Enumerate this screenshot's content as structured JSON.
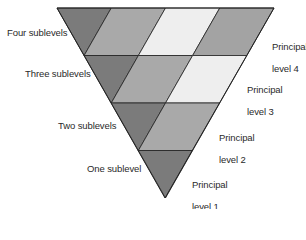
{
  "colors": {
    "dark": "#7b7b7b",
    "mid": "#a9a9a9",
    "mid2": "#a3a3a3",
    "light": "#eeeeee",
    "stroke": "#222222"
  },
  "left_labels": [
    {
      "text": "Four sublevels",
      "x": 7,
      "y": 27
    },
    {
      "text": "Three sublevels",
      "x": 25,
      "y": 68
    },
    {
      "text": "Two sublevels",
      "x": 58,
      "y": 120
    },
    {
      "text": "One sublevel",
      "x": 87,
      "y": 163
    }
  ],
  "right_labels": [
    {
      "line1": "Principal",
      "line2": "level 4",
      "x": 272,
      "y": 30
    },
    {
      "line1": "Principal",
      "line2": "level 3",
      "x": 247,
      "y": 73
    },
    {
      "line1": "Principal",
      "line2": "level 2",
      "x": 219,
      "y": 121
    },
    {
      "line1": "Principal",
      "line2": "level 1",
      "x": 192,
      "y": 168
    }
  ],
  "rows": [
    {
      "level": 4,
      "sublevels": 4,
      "cells": [
        "dark",
        "mid",
        "light",
        "mid2"
      ]
    },
    {
      "level": 3,
      "sublevels": 3,
      "cells": [
        "dark",
        "mid",
        "light"
      ]
    },
    {
      "level": 2,
      "sublevels": 2,
      "cells": [
        "dark",
        "mid"
      ]
    },
    {
      "level": 1,
      "sublevels": 1,
      "cells": [
        "dark"
      ]
    }
  ]
}
